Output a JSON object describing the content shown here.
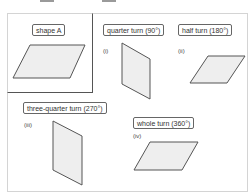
{
  "diagram": {
    "original": {
      "label": "shape A"
    },
    "rotations": [
      {
        "numeral": "(i)",
        "label": "quarter turn (90°)"
      },
      {
        "numeral": "(ii)",
        "label": "half turn (180°)"
      },
      {
        "numeral": "(iii)",
        "label": "three-quarter turn (270°)"
      },
      {
        "numeral": "(iv)",
        "label": "whole turn (360°)"
      }
    ],
    "colors": {
      "shape_fill": "#eeeeee",
      "shape_stroke": "#555555",
      "frame_border": "#d4d4d4"
    }
  }
}
